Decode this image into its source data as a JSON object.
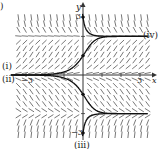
{
  "figure": {
    "panel_label": ")",
    "axis_labels": {
      "x": "x",
      "y": "y"
    },
    "tick_labels": {
      "x_neg": "−3",
      "x_pos": "3",
      "y_pos": "3",
      "y_neg": "−3"
    },
    "curve_labels": {
      "i": "(i)",
      "ii": "(ii)",
      "iii": "(iii)",
      "iv": "(iv)"
    }
  },
  "chart_data": {
    "type": "slope_field",
    "title": "",
    "xlabel": "x",
    "ylabel": "y",
    "xlim": [
      -3,
      3
    ],
    "ylim": [
      -3,
      3
    ],
    "x_ticks": [
      -3,
      -2,
      -1,
      0,
      1,
      2,
      3
    ],
    "y_ticks": [
      -3,
      -2,
      -1,
      0,
      1,
      2,
      3
    ],
    "labeled_ticks": {
      "x": [
        -3,
        3
      ],
      "y": [
        -3,
        3
      ]
    },
    "equilibria": [
      -2,
      0,
      2
    ],
    "slope_sign_regions": [
      {
        "y_range": [
          2,
          3
        ],
        "slope": "negative"
      },
      {
        "y_range": [
          0,
          2
        ],
        "slope": "positive"
      },
      {
        "y_range": [
          -2,
          0
        ],
        "slope": "negative"
      },
      {
        "y_range": [
          -3,
          -2
        ],
        "slope": "positive"
      }
    ],
    "solution_curves": [
      {
        "label": "(i)",
        "initial_point": [
          0,
          1
        ],
        "behavior": "increases from ~0 as x→−∞ to 2 as x→∞"
      },
      {
        "label": "(ii)",
        "initial_point": [
          0,
          -1
        ],
        "behavior": "decreases from ~0 as x→−∞ to −2 as x→∞"
      },
      {
        "label": "(iii)",
        "initial_point": [
          0,
          -3
        ],
        "behavior": "increases from −3 toward −2"
      },
      {
        "label": "(iv)",
        "initial_point": [
          0,
          3
        ],
        "behavior": "decreases from 3 toward 2"
      }
    ],
    "grid": false,
    "colors": {
      "field": "#555555",
      "curve": "#111111",
      "axis": "#333333"
    }
  }
}
